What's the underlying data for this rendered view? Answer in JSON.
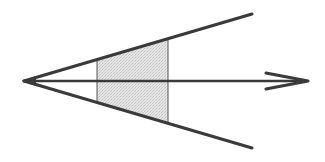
{
  "diagram": {
    "colors": {
      "background": "#ffffff",
      "stroke": "#3a3a3a",
      "thin_stroke": "#555555",
      "shade": "#d9d9d9"
    },
    "apex": {
      "x": 24,
      "y": 81
    },
    "upper_edge_end": {
      "x": 252,
      "y": 14
    },
    "lower_edge_end": {
      "x": 252,
      "y": 148
    },
    "axis_arrow": {
      "x1": 24,
      "y1": 81,
      "x2": 308,
      "y2": 81
    },
    "shaded_section": {
      "left_cut_x": 97,
      "right_cut_x": 168
    }
  }
}
